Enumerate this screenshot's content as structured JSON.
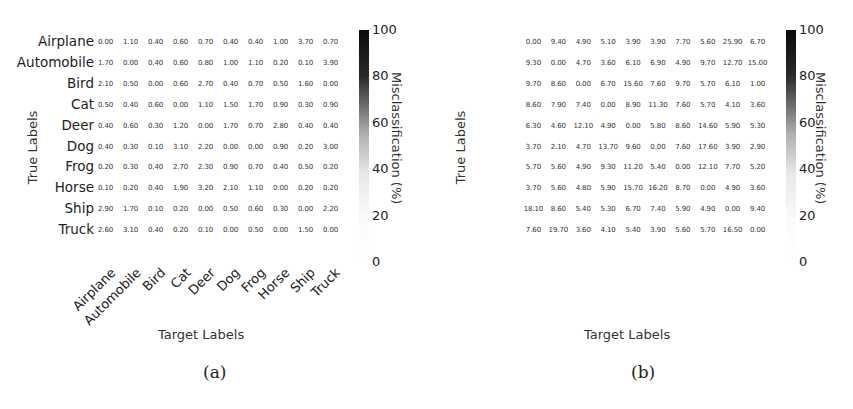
{
  "chart_data": [
    {
      "type": "heatmap",
      "panel": "(a)",
      "title": "",
      "xlabel": "Target Labels",
      "ylabel": "True Labels",
      "colorbar_label": "Misclassification (%)",
      "colorbar_ticks": [
        "100",
        "80",
        "60",
        "40",
        "20",
        "0"
      ],
      "colorbar_range": [
        0,
        100
      ],
      "colormap": "white-to-black",
      "row_labels": [
        "Airplane",
        "Automobile",
        "Bird",
        "Cat",
        "Deer",
        "Dog",
        "Frog",
        "Horse",
        "Ship",
        "Truck"
      ],
      "col_labels": [
        "Airplane",
        "Automobile",
        "Bird",
        "Cat",
        "Deer",
        "Dog",
        "Frog",
        "Horse",
        "Ship",
        "Truck"
      ],
      "values": [
        [
          "0.00",
          "1.10",
          "0.40",
          "0.60",
          "0.70",
          "0.40",
          "0.40",
          "1.00",
          "3.70",
          "0.70"
        ],
        [
          "1.70",
          "0.00",
          "0.40",
          "0.60",
          "0.80",
          "1.00",
          "1.10",
          "0.20",
          "0.10",
          "3.90"
        ],
        [
          "2.10",
          "0.50",
          "0.00",
          "0.60",
          "2.70",
          "0.40",
          "0.70",
          "0.50",
          "1.60",
          "0.00"
        ],
        [
          "0.50",
          "0.40",
          "0.60",
          "0.00",
          "1.10",
          "1.50",
          "1.70",
          "0.90",
          "0.30",
          "0.90"
        ],
        [
          "0.40",
          "0.60",
          "0.30",
          "1.20",
          "0.00",
          "1.70",
          "0.70",
          "2.80",
          "0.40",
          "0.40"
        ],
        [
          "0.40",
          "0.30",
          "0.10",
          "3.10",
          "2.20",
          "0.00",
          "0.00",
          "0.90",
          "0.20",
          "3.00"
        ],
        [
          "0.20",
          "0.30",
          "0.40",
          "2.70",
          "2.30",
          "0.90",
          "0.70",
          "0.40",
          "0.50",
          "0.20"
        ],
        [
          "0.10",
          "0.20",
          "0.40",
          "1.90",
          "3.20",
          "2.10",
          "1.10",
          "0.00",
          "0.20",
          "0.20"
        ],
        [
          "2.90",
          "1.70",
          "0.10",
          "0.20",
          "0.00",
          "0.50",
          "0.60",
          "0.30",
          "0.00",
          "2.20"
        ],
        [
          "2.60",
          "3.10",
          "0.40",
          "0.20",
          "0.10",
          "0.00",
          "0.50",
          "0.00",
          "1.50",
          "0.00"
        ]
      ]
    },
    {
      "type": "heatmap",
      "panel": "(b)",
      "title": "",
      "xlabel": "Target Labels",
      "ylabel": "True Labels",
      "colorbar_label": "Misclassification (%)",
      "colorbar_ticks": [
        "100",
        "80",
        "60",
        "40",
        "20",
        "0"
      ],
      "colorbar_range": [
        0,
        100
      ],
      "colormap": "white-to-black",
      "row_labels": [
        "Airplane",
        "Automobile",
        "Bird",
        "Cat",
        "Deer",
        "Dog",
        "Frog",
        "Horse",
        "Ship",
        "Truck"
      ],
      "col_labels": [
        "Airplane",
        "Automobile",
        "Bird",
        "Cat",
        "Deer",
        "Dog",
        "Frog",
        "Horse",
        "Ship",
        "Truck"
      ],
      "values": [
        [
          "0.00",
          "9.40",
          "4.90",
          "5.10",
          "3.90",
          "3.90",
          "7.70",
          "5.60",
          "25.90",
          "6.70"
        ],
        [
          "9.30",
          "0.00",
          "4.70",
          "3.60",
          "6.10",
          "6.90",
          "4.90",
          "9.70",
          "12.70",
          "15.00"
        ],
        [
          "9.70",
          "8.60",
          "0.00",
          "6.70",
          "15.60",
          "7.60",
          "9.70",
          "5.70",
          "6.10",
          "1.00"
        ],
        [
          "8.60",
          "7.90",
          "7.40",
          "0.00",
          "8.90",
          "11.30",
          "7.60",
          "5.70",
          "4.10",
          "3.60"
        ],
        [
          "6.30",
          "4.60",
          "12.10",
          "4.90",
          "0.00",
          "5.80",
          "8.60",
          "14.60",
          "5.90",
          "5.30"
        ],
        [
          "3.70",
          "2.10",
          "4.70",
          "13.70",
          "9.60",
          "0.00",
          "7.60",
          "17.60",
          "3.90",
          "2.90"
        ],
        [
          "5.70",
          "5.60",
          "4.90",
          "9.30",
          "11.20",
          "5.40",
          "0.00",
          "12.10",
          "7.70",
          "5.20"
        ],
        [
          "3.70",
          "5.60",
          "4.80",
          "5.90",
          "15.70",
          "16.20",
          "8.70",
          "0.00",
          "4.90",
          "3.60"
        ],
        [
          "18.10",
          "8.60",
          "5.40",
          "5.30",
          "6.70",
          "7.40",
          "5.90",
          "4.90",
          "0.00",
          "9.40"
        ],
        [
          "7.60",
          "19.70",
          "3.60",
          "4.10",
          "5.40",
          "3.90",
          "5.60",
          "5.70",
          "16.50",
          "0.00"
        ]
      ]
    }
  ],
  "captions": [
    "(a)",
    "(b)"
  ]
}
